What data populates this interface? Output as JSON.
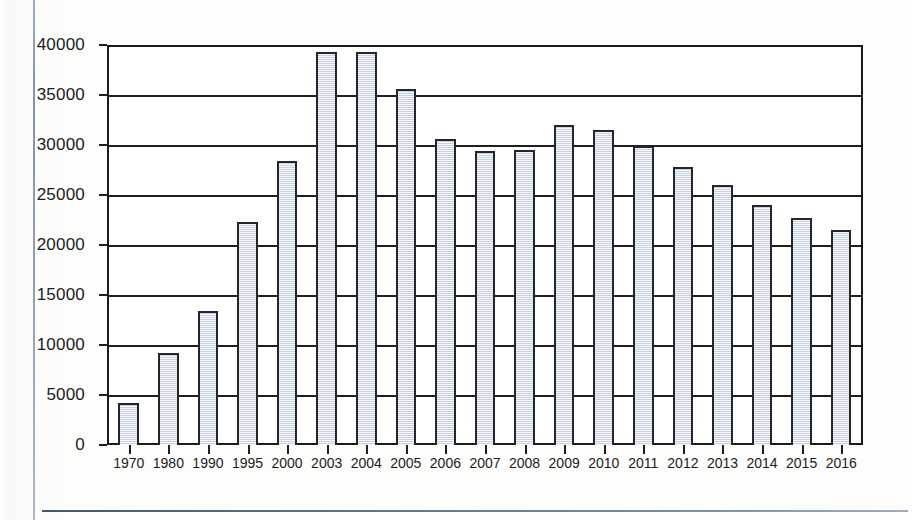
{
  "document": {
    "margin_rule_color": "#7d8da6",
    "footer_rule_color": "#45586f",
    "page_background": "#fdfdfb"
  },
  "chart_data": {
    "type": "bar",
    "title": "",
    "subtitle": "",
    "xlabel": "",
    "ylabel": "",
    "ylim": [
      0,
      40000
    ],
    "ytick_values": [
      0,
      5000,
      10000,
      15000,
      20000,
      25000,
      30000,
      35000,
      40000
    ],
    "ytick_labels": [
      "0",
      "5000",
      "10000",
      "15000",
      "20000",
      "25000",
      "30000",
      "35000",
      "40000"
    ],
    "grid": true,
    "legend": false,
    "legend_position": "none",
    "bar_fill_color": "#dde2ec",
    "bar_edge_color": "#23262b",
    "axis_color": "#1f1f1f",
    "categories": [
      "1970",
      "1980",
      "1990",
      "1995",
      "2000",
      "2003",
      "2004",
      "2005",
      "2006",
      "2007",
      "2008",
      "2009",
      "2010",
      "2011",
      "2012",
      "2013",
      "2014",
      "2015",
      "2016"
    ],
    "values": [
      4200,
      9200,
      13500,
      22400,
      28500,
      39500,
      39500,
      35800,
      30800,
      29500,
      29700,
      32200,
      31700,
      30100,
      27900,
      26100,
      24100,
      22800,
      21600
    ]
  }
}
